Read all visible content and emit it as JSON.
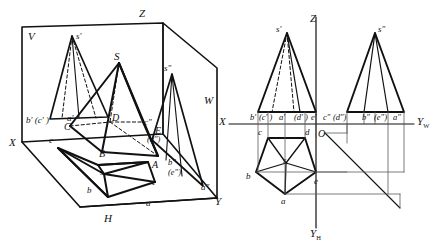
{
  "figure": {
    "type": "descriptive-geometry-diagram",
    "stroke_color": "#111111",
    "background": "#ffffff"
  },
  "pictorial_view": {
    "name": "three-plane projection box (pictorial)",
    "plane_labels": [
      {
        "id": "V",
        "text": "V"
      },
      {
        "id": "W",
        "text": "W"
      },
      {
        "id": "H",
        "text": "H"
      }
    ],
    "axis_labels": [
      {
        "id": "Z",
        "text": "Z"
      },
      {
        "id": "X",
        "text": "X"
      },
      {
        "id": "Y",
        "text": "Y"
      }
    ],
    "object_labels": [
      {
        "id": "S",
        "text": "S"
      },
      {
        "id": "A",
        "text": "A"
      },
      {
        "id": "B",
        "text": "B"
      },
      {
        "id": "C",
        "text": "C"
      },
      {
        "id": "D",
        "text": "D"
      },
      {
        "id": "E",
        "text": "E"
      }
    ],
    "v_projection_labels": [
      {
        "id": "s-prime",
        "text": "s′"
      },
      {
        "id": "bc-prime",
        "text": "b′ (c′ )"
      },
      {
        "id": "a-prime",
        "text": "a′"
      }
    ],
    "w_projection_labels": [
      {
        "id": "s-dprime",
        "text": "s″"
      },
      {
        "id": "c-dprime",
        "text": "c″"
      },
      {
        "id": "d-dprime",
        "text": "(d″)"
      },
      {
        "id": "b-dprime",
        "text": "b″"
      },
      {
        "id": "e-dprime",
        "text": "(e″)"
      },
      {
        "id": "a-dprime",
        "text": "a″"
      }
    ],
    "h_projection_labels": [
      {
        "id": "s-h",
        "text": "s"
      },
      {
        "id": "a-h",
        "text": "a"
      },
      {
        "id": "b-h",
        "text": "b"
      },
      {
        "id": "c-h",
        "text": "c"
      },
      {
        "id": "e-h",
        "text": "e"
      }
    ]
  },
  "orthographic_view": {
    "name": "unfolded three-view drawing",
    "axis_labels": [
      {
        "id": "Z",
        "text": "Z"
      },
      {
        "id": "X",
        "text": "X"
      },
      {
        "id": "O",
        "text": "O"
      },
      {
        "id": "Yw",
        "text": "Y",
        "subscript": "W"
      },
      {
        "id": "Yh",
        "text": "Y",
        "subscript": "H"
      }
    ],
    "front_view": {
      "name": "front view (V projection)",
      "apex": {
        "id": "s-prime",
        "text": "s′"
      },
      "base_labels": [
        {
          "id": "b-prime",
          "text": "b′"
        },
        {
          "id": "c-prime",
          "text": "(c′ )"
        },
        {
          "id": "a-prime",
          "text": "a′"
        },
        {
          "id": "d-prime",
          "text": "(d′ )"
        },
        {
          "id": "e-prime",
          "text": "e′"
        }
      ]
    },
    "side_view": {
      "name": "side view (W projection)",
      "apex": {
        "id": "s-dprime",
        "text": "s″"
      },
      "base_labels": [
        {
          "id": "c-dprime",
          "text": "c″"
        },
        {
          "id": "d-dprime",
          "text": "(d″)"
        },
        {
          "id": "b-dprime",
          "text": "b″"
        },
        {
          "id": "e-dprime",
          "text": "(e″)"
        },
        {
          "id": "a-dprime",
          "text": "a″"
        }
      ]
    },
    "top_view": {
      "name": "top view (H projection)",
      "center": {
        "id": "s",
        "text": "s"
      },
      "vertex_labels": [
        {
          "id": "c",
          "text": "c"
        },
        {
          "id": "d",
          "text": "d"
        },
        {
          "id": "b",
          "text": "b"
        },
        {
          "id": "e",
          "text": "e"
        },
        {
          "id": "a",
          "text": "a"
        }
      ]
    }
  }
}
